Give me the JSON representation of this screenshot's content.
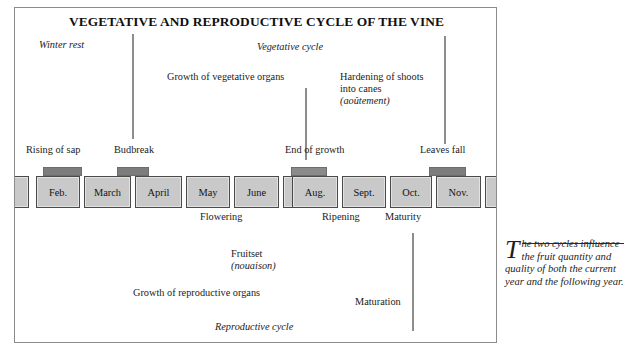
{
  "figure": {
    "title": "VEGETATIVE AND REPRODUCTIVE CYCLE OF THE VINE",
    "frame_color": "#8b8b8b"
  },
  "cycles": {
    "vegetative": "Vegetative cycle",
    "reproductive": "Reproductive cycle"
  },
  "upper_labels": {
    "winter_rest": "Winter rest",
    "growth_vegetative": "Growth of vegetative organs",
    "hardening_line1": "Hardening of shoots",
    "hardening_line2": "into canes",
    "hardening_line3": "(aoûtement)",
    "rising_of_sap": "Rising of sap",
    "budbreak": "Budbreak",
    "end_of_growth": "End of growth",
    "leaves_fall": "Leaves fall"
  },
  "lower_labels": {
    "flowering": "Flowering",
    "ripening": "Ripening",
    "maturity": "Maturity",
    "fruitset": "Fruitset",
    "fruitset_fr": "(nouaison)",
    "growth_reproductive": "Growth of reproductive organs",
    "maturation": "Maturation"
  },
  "timeline": {
    "months": [
      {
        "label": "",
        "partial": true
      },
      {
        "label": "Feb.",
        "partial": false
      },
      {
        "label": "March",
        "partial": false
      },
      {
        "label": "April",
        "partial": false
      },
      {
        "label": "May",
        "partial": false
      },
      {
        "label": "June",
        "partial": false
      },
      {
        "label": "July",
        "partial": false
      },
      {
        "label": "Aug.",
        "partial": false
      },
      {
        "label": "Sept.",
        "partial": false
      },
      {
        "label": "Oct.",
        "partial": false
      },
      {
        "label": "Nov.",
        "partial": false
      },
      {
        "label": "",
        "partial": true
      }
    ]
  },
  "caption": {
    "dropcap": "T",
    "text": "he two cycles influence the fruit quantity and quality of both the current year and the following year."
  }
}
